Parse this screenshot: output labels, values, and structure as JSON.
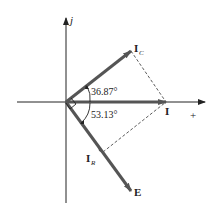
{
  "diagram": {
    "type": "phasor-diagram",
    "axes": {
      "vertical_label": "j",
      "horizontal_label": "+"
    },
    "phasors": [
      {
        "name": "I_C",
        "label_main": "I",
        "label_sub": "C",
        "angle_deg": 36.87
      },
      {
        "name": "I",
        "label_main": "I",
        "label_sub": "",
        "angle_deg": 0
      },
      {
        "name": "I_R",
        "label_main": "I",
        "label_sub": "R",
        "angle_deg": -53.13
      },
      {
        "name": "E",
        "label_main": "E",
        "label_sub": "",
        "angle_deg": -53.13
      }
    ],
    "angles": {
      "upper": "36.87°",
      "lower": "53.13°"
    },
    "colors": {
      "axis": "#222222",
      "phasor": "#555555",
      "dashed": "#333333"
    }
  }
}
